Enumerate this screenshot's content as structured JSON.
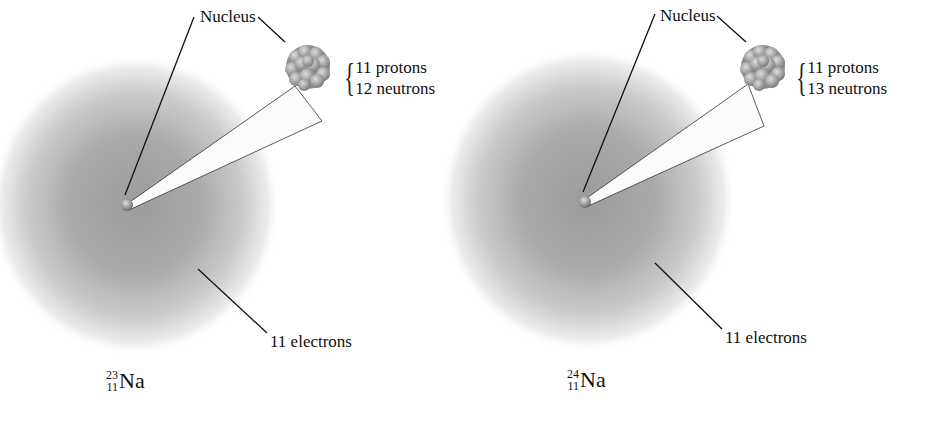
{
  "figure": {
    "atoms": [
      {
        "id": "na-23",
        "nucleus_label": "Nucleus",
        "protons_label": "11 protons",
        "neutrons_label": "12 neutrons",
        "electrons_label": "11 electrons",
        "isotope": {
          "mass_number": "23",
          "atomic_number": "11",
          "symbol": "Na"
        },
        "protons": 11,
        "neutrons": 12,
        "electrons": 11
      },
      {
        "id": "na-24",
        "nucleus_label": "Nucleus",
        "protons_label": "11 protons",
        "neutrons_label": "13 neutrons",
        "electrons_label": "11 electrons",
        "isotope": {
          "mass_number": "24",
          "atomic_number": "11",
          "symbol": "Na"
        },
        "protons": 11,
        "neutrons": 13,
        "electrons": 11
      }
    ],
    "colors": {
      "background": "#ffffff",
      "cloud_dark": "#9a9a9a",
      "cloud_edge": "#ffffff",
      "nucleus_ball": "#a8a8a8",
      "line": "#111111",
      "text": "#111111"
    }
  }
}
